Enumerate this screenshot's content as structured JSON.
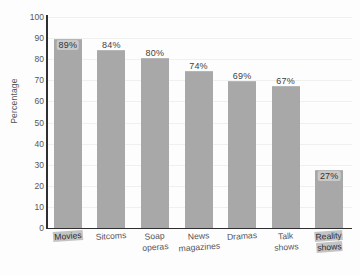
{
  "chart_data": {
    "type": "bar",
    "title": "",
    "xlabel": "",
    "ylabel": "Percentage",
    "ylim": [
      0,
      100
    ],
    "ytick_step": 10,
    "yticks": [
      "100",
      "90",
      "80",
      "70",
      "60",
      "50",
      "40",
      "30",
      "20",
      "10",
      "0"
    ],
    "grid": true,
    "legend": "none",
    "categories": [
      "Movies",
      "Soap operas",
      "Sitcoms",
      "News magazines",
      "Dramas",
      "Talk shows",
      "Reality shows"
    ],
    "bars": [
      {
        "category": "Movies",
        "line1": "Movies",
        "line2": "",
        "value": 89,
        "label": "89%",
        "smudged": true
      },
      {
        "category": "Sitcoms",
        "line1": "Sitcoms",
        "line2": "",
        "value": 84,
        "label": "84%",
        "smudged": false
      },
      {
        "category": "Soap operas",
        "line1": "Soap",
        "line2": "operas",
        "value": 80,
        "label": "80%",
        "smudged": false
      },
      {
        "category": "News magazines",
        "line1": "News",
        "line2": "magazines",
        "value": 74,
        "label": "74%",
        "smudged": false
      },
      {
        "category": "Dramas",
        "line1": "Dramas",
        "line2": "",
        "value": 69,
        "label": "69%",
        "smudged": false
      },
      {
        "category": "Talk shows",
        "line1": "Talk",
        "line2": "shows",
        "value": 67,
        "label": "67%",
        "smudged": false
      },
      {
        "category": "Reality shows",
        "line1": "Reality",
        "line2": "shows",
        "value": 27,
        "label": "27%",
        "smudged": true
      }
    ],
    "values": [
      89,
      84,
      80,
      74,
      69,
      67,
      27
    ],
    "colors": {
      "bar_fill": "#a8a8a8",
      "axis": "#2f2f31",
      "gridline": "#eff0f0",
      "text": "#55565a",
      "background": "#fdfdfd"
    }
  }
}
